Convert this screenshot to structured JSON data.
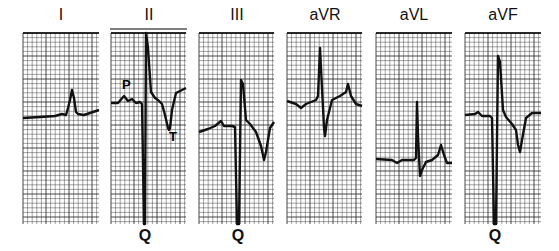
{
  "figure": {
    "type": "ecg-limb-leads",
    "grid_color": "#333333",
    "trace_color": "#111111",
    "leads": [
      {
        "name": "I",
        "x": 23,
        "y": 33,
        "w": 76,
        "h": 191,
        "q_label": "",
        "trace": "M23,118 L40,117 L55,116 L62,114 L66,115 L68,108 L70,100 L72,90 L74,98 L76,112 L78,114 L84,115 L90,113 L99,110",
        "annotations": []
      },
      {
        "name": "II",
        "x": 111,
        "y": 33,
        "w": 75,
        "h": 191,
        "q_label": "Q",
        "label_bar": true,
        "trace": "M111,103 L118,103 L124,96 L128,101 L132,99 L136,103 L140,102 L142,104 L144,224 L145,224 L146,33 L148,48 L151,92 L155,98 L158,100 L162,104 L165,115 L168,128 L169,130 L170,128 L172,110 L176,93 L182,90 L186,88",
        "annotations": [
          {
            "text": "P",
            "x": 122,
            "y": 89
          },
          {
            "text": "T",
            "x": 169,
            "y": 141
          }
        ]
      },
      {
        "name": "III",
        "x": 199,
        "y": 33,
        "w": 75,
        "h": 191,
        "q_label": "Q",
        "trace": "M199,132 L208,129 L215,126 L221,121 L224,126 L232,126 L235,127 L237,224 L239,224 L241,80 L243,84 L246,120 L250,124 L256,132 L261,146 L264,160 L266,152 L270,128 L274,122",
        "annotations": []
      },
      {
        "name": "aVR",
        "x": 287,
        "y": 33,
        "w": 75,
        "h": 191,
        "q_label": "",
        "trace": "M287,101 L296,104 L301,108 L306,104 L316,100 L318,96 L320,48 L322,88 L324,128 L325,136 L327,120 L332,100 L340,96 L346,92 L348,84 L351,96 L356,104 L362,106",
        "annotations": []
      },
      {
        "name": "aVL",
        "x": 376,
        "y": 33,
        "w": 76,
        "h": 191,
        "q_label": "",
        "trace": "M376,159 L392,160 L397,163 L402,160 L414,160 L416,158 L417,102 L418,136 L420,176 L422,170 L426,162 L432,160 L438,155 L441,145 L444,155 L447,163 L452,163",
        "annotations": []
      },
      {
        "name": "aVF",
        "x": 465,
        "y": 33,
        "w": 76,
        "h": 191,
        "q_label": "Q",
        "trace": "M465,115 L475,114 L478,112 L482,116 L490,116 L492,118 L494,224 L496,224 L498,56 L500,62 L503,110 L506,117 L512,124 L516,130 L518,145 L520,152 L522,140 L526,118 L532,113 L541,113",
        "annotations": []
      }
    ]
  }
}
